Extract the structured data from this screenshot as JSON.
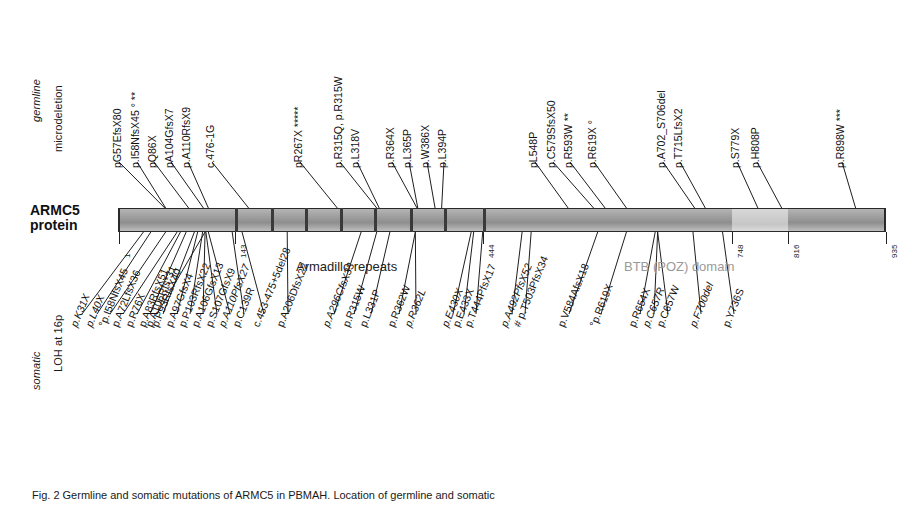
{
  "figure": {
    "protein_name_line1": "ARMC5",
    "protein_name_line2": "protein",
    "caption": "Fig. 2  Germline and somatic mutations of ARMC5 in PBMAH. Location of germline and somatic"
  },
  "axis_labels": {
    "germline": "germline",
    "microdeletion": "microdeletion",
    "somatic": "somatic",
    "loh": "LOH at 16p"
  },
  "domains": {
    "armadillo_repeats": "Armadillo repeats",
    "btb_poz": "BTB (POZ) domain",
    "btb_color": "#9a9a9a"
  },
  "positions": [
    {
      "label": "1",
      "aa": 1
    },
    {
      "label": "143",
      "aa": 143
    },
    {
      "label": "444",
      "aa": 444
    },
    {
      "label": "748",
      "aa": 748
    },
    {
      "label": "816",
      "aa": 816
    },
    {
      "label": "935",
      "aa": 935
    }
  ],
  "bar": {
    "total_aa": 935,
    "segments": [
      {
        "name": "n-terminal-and-armadillo",
        "start": 1,
        "end": 748,
        "shade": "dark"
      },
      {
        "name": "btb-poz-domain",
        "start": 748,
        "end": 816,
        "shade": "light"
      },
      {
        "name": "c-terminal",
        "start": 816,
        "end": 935,
        "shade": "dark"
      }
    ],
    "armadillo_repeat_ticks": [
      143,
      186,
      228,
      270,
      312,
      355,
      397,
      444
    ]
  },
  "germline_mutations": [
    {
      "label": "pG57EfsX80",
      "aa": 57,
      "x": 122
    },
    {
      "label": "p.I58NfsX45 ° **",
      "aa": 58,
      "x": 140
    },
    {
      "label": "pQ86X",
      "aa": 86,
      "x": 157
    },
    {
      "label": "pA104GfsX7",
      "aa": 104,
      "x": 174
    },
    {
      "label": "p.A110RfsX9",
      "aa": 110,
      "x": 191
    },
    {
      "label": "c.476-1G",
      "aa": 159,
      "x": 215
    },
    {
      "label": "pR267X *****",
      "aa": 267,
      "x": 303
    },
    {
      "label": "p.R315Q, p.R315W",
      "aa": 315,
      "x": 343
    },
    {
      "label": "p.L318V",
      "aa": 318,
      "x": 360
    },
    {
      "label": "p.R364X",
      "aa": 364,
      "x": 395
    },
    {
      "label": "p.L365P",
      "aa": 365,
      "x": 412
    },
    {
      "label": "p.W386X",
      "aa": 386,
      "x": 430
    },
    {
      "label": "p.L394P",
      "aa": 394,
      "x": 447
    },
    {
      "label": "pL548P",
      "aa": 548,
      "x": 538
    },
    {
      "label": "p.C579SfsX50",
      "aa": 579,
      "x": 556
    },
    {
      "label": "p.R593W **",
      "aa": 593,
      "x": 573
    },
    {
      "label": "p.R619X °",
      "aa": 619,
      "x": 597
    },
    {
      "label": "p.A702_S706del",
      "aa": 702,
      "x": 666
    },
    {
      "label": "p.T715LfsX2",
      "aa": 715,
      "x": 683
    },
    {
      "label": "p.S779X",
      "aa": 779,
      "x": 740
    },
    {
      "label": "p.H808P",
      "aa": 808,
      "x": 760
    },
    {
      "label": "p.R898W ***",
      "aa": 898,
      "x": 845
    }
  ],
  "somatic_mutations": [
    {
      "label": "p.K31X",
      "aa": 31,
      "italic": true,
      "x": 78
    },
    {
      "label": "p.L40X",
      "aa": 40,
      "italic": true,
      "x": 93
    },
    {
      "label": "°p.I58NfsX45",
      "aa": 58,
      "italic": false,
      "x": 106
    },
    {
      "label": "p.A72LfsX36",
      "aa": 72,
      "italic": false,
      "x": 119
    },
    {
      "label": "p.R76X",
      "aa": 76,
      "italic": false,
      "x": 133
    },
    {
      "label": "p.A83RfsX51",
      "aa": 83,
      "italic": false,
      "x": 146
    },
    {
      "label": "p.P93RfsX40",
      "aa": 93,
      "italic": false,
      "x": 159
    },
    {
      "label": "p.A97GfsX4",
      "aa": 97,
      "italic": false,
      "x": 173
    },
    {
      "label": "p.P103RfsX22",
      "aa": 103,
      "italic": false,
      "x": 186
    },
    {
      "label": "p.A106GfsX13",
      "aa": 106,
      "italic": false,
      "x": 199
    },
    {
      "label": "p.A106Rfs*31",
      "aa": 106,
      "italic": false,
      "x": 153
    },
    {
      "label": "p.S107GfsX9",
      "aa": 107,
      "italic": false,
      "x": 213
    },
    {
      "label": "p.A110PfsX27",
      "aa": 110,
      "italic": true,
      "x": 226
    },
    {
      "label": "p.C139R",
      "aa": 139,
      "italic": false,
      "x": 240
    },
    {
      "label": "c.453-475+5del28",
      "aa": 151,
      "italic": false,
      "x": 260
    },
    {
      "label": "p.A206DfsX22",
      "aa": 206,
      "italic": false,
      "x": 284
    },
    {
      "label": "p.A296CfsX33",
      "aa": 296,
      "italic": true,
      "x": 330
    },
    {
      "label": "p.R315W",
      "aa": 315,
      "italic": false,
      "x": 350
    },
    {
      "label": "p.L331P",
      "aa": 331,
      "italic": false,
      "x": 367
    },
    {
      "label": "p.R362W",
      "aa": 362,
      "italic": false,
      "x": 395
    },
    {
      "label": "p.R362L",
      "aa": 362,
      "italic": true,
      "x": 412
    },
    {
      "label": "p.E430X",
      "aa": 430,
      "italic": true,
      "x": 449
    },
    {
      "label": "p.E433X",
      "aa": 433,
      "italic": false,
      "x": 460
    },
    {
      "label": "p.T444PfsX17",
      "aa": 444,
      "italic": false,
      "x": 472
    },
    {
      "label": "p.A492PfsX52",
      "aa": 492,
      "italic": true,
      "x": 508
    },
    {
      "label": "# p.T503PfsX34",
      "aa": 503,
      "italic": false,
      "x": 521
    },
    {
      "label": "p.V584AfsX18",
      "aa": 584,
      "italic": false,
      "x": 565
    },
    {
      "label": "°p.R619X",
      "aa": 619,
      "italic": false,
      "x": 597
    },
    {
      "label": "p.R654X",
      "aa": 654,
      "italic": false,
      "x": 636
    },
    {
      "label": "p.C657R",
      "aa": 657,
      "italic": true,
      "x": 650
    },
    {
      "label": "p.C657W",
      "aa": 657,
      "italic": false,
      "x": 664
    },
    {
      "label": "p.F700del",
      "aa": 700,
      "italic": true,
      "x": 697
    },
    {
      "label": "p.Y736S",
      "aa": 736,
      "italic": false,
      "x": 730
    }
  ]
}
